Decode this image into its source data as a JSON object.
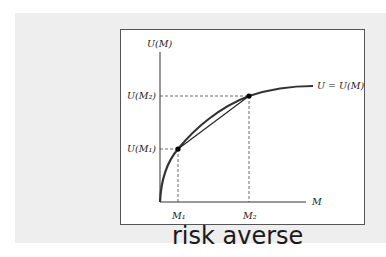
{
  "diagram": {
    "y_axis_label": "U(M)",
    "x_axis_label": "M",
    "curve_label": "U = U(M)",
    "y_ticks": [
      "U(M₂)",
      "U(M₁)"
    ],
    "x_ticks": [
      "M₁",
      "M₂"
    ],
    "annotation": "risk averse",
    "points": [
      {
        "name": "M1",
        "label_x": "M₁",
        "label_y": "U(M₁)"
      },
      {
        "name": "M2",
        "label_x": "M₂",
        "label_y": "U(M₂)"
      }
    ],
    "colors": {
      "curve": "#333333",
      "band": "#eeeeee",
      "box_border": "#555555"
    }
  }
}
